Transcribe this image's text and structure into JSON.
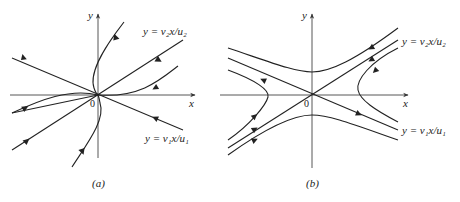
{
  "figure": {
    "panels": [
      {
        "id": "a",
        "caption": "(a)",
        "type": "stable-node-phase-portrait",
        "axes": {
          "x_label": "x",
          "y_label": "y",
          "origin_label": "0"
        },
        "eigen_lines": [
          {
            "label": "y = v₂x/u₂"
          },
          {
            "label": "y = v₁x/u₁"
          }
        ]
      },
      {
        "id": "b",
        "caption": "(b)",
        "type": "saddle-point-phase-portrait",
        "axes": {
          "x_label": "x",
          "y_label": "y",
          "origin_label": "0"
        },
        "eigen_lines": [
          {
            "label": "y = v₂x/u₂"
          },
          {
            "label": "y = v₁x/u₁"
          }
        ]
      }
    ],
    "colors": {
      "line": "#222222",
      "axis": "#444444",
      "background": "#ffffff"
    }
  }
}
